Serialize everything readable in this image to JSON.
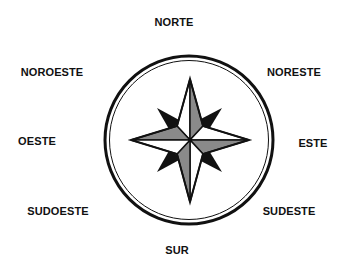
{
  "diagram": {
    "type": "compass-rose",
    "directions": {
      "north": "NORTE",
      "northeast": "NORESTE",
      "east": "ESTE",
      "southeast": "SUDESTE",
      "south": "SUR",
      "southwest": "SUDOESTE",
      "west": "OESTE",
      "northwest": "NOROESTE"
    },
    "colors": {
      "stroke": "#111111",
      "gray": "#8a8a8a",
      "white": "#ffffff",
      "diagonal_points": "#111111"
    }
  }
}
